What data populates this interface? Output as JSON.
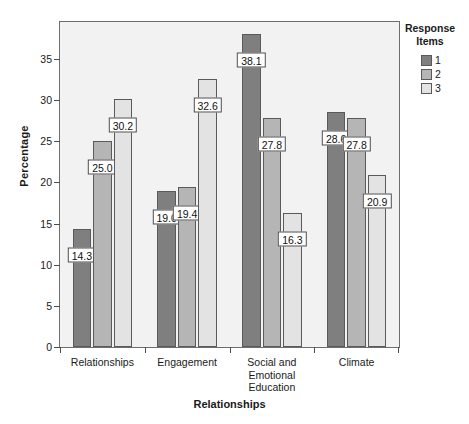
{
  "chart_data": {
    "type": "bar",
    "title": "",
    "xlabel": "Relationships",
    "ylabel": "Percentage",
    "categories": [
      "Relationships",
      "Engagement",
      "Social and\nEmotional\nEducation",
      "Climate"
    ],
    "series": [
      {
        "name": "1",
        "color": "#7f7f7f",
        "values": [
          14.3,
          19.0,
          38.1,
          28.6
        ]
      },
      {
        "name": "2",
        "color": "#b5b5b5",
        "values": [
          25.0,
          19.4,
          27.8,
          27.8
        ]
      },
      {
        "name": "3",
        "color": "#e3e3e3",
        "values": [
          30.2,
          32.6,
          16.3,
          20.9
        ]
      }
    ],
    "ylim": [
      0,
      39.5
    ],
    "yticks": [
      0,
      5,
      10,
      15,
      20,
      25,
      30,
      35
    ],
    "ytick_labels": [
      "0",
      "5",
      "10",
      "15",
      "20",
      "25",
      "30",
      "35"
    ],
    "grid": false,
    "legend": {
      "title": "Response\nItems",
      "title_lines": [
        "Response",
        "Items"
      ],
      "position": "right",
      "entries": [
        "1",
        "2",
        "3"
      ]
    },
    "data_labels": [
      [
        "14.3",
        "25.0",
        "30.2"
      ],
      [
        "19.0",
        "19.4",
        "32.6"
      ],
      [
        "38.1",
        "27.8",
        "16.3"
      ],
      [
        "28.6",
        "27.8",
        "20.9"
      ]
    ],
    "plot_background": "#f2f2f2",
    "axis_color": "#4d4d4d"
  }
}
